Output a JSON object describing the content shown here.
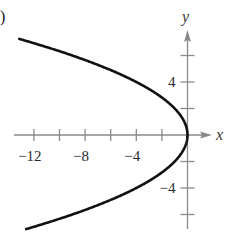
{
  "panel_label": ")",
  "chart_data": {
    "type": "line",
    "title": "",
    "equation": "y^2 = -4x",
    "xlabel": "x",
    "ylabel": "y",
    "xlim": [
      -12.2,
      1.6
    ],
    "ylim": [
      -7.2,
      7.8
    ],
    "grid": false,
    "legend": null,
    "x_ticks": [
      -12,
      -10,
      -8,
      -6,
      -4,
      -2
    ],
    "x_tick_labels": [
      {
        "value": -12,
        "label": "−12"
      },
      {
        "value": -8,
        "label": "−8"
      },
      {
        "value": -4,
        "label": "−4"
      }
    ],
    "y_ticks": [
      -6,
      -4,
      -2,
      2,
      4,
      6
    ],
    "y_tick_labels": [
      {
        "value": 4,
        "label": "4"
      },
      {
        "value": -4,
        "label": "−4"
      }
    ],
    "series": [
      {
        "name": "parabola",
        "color": "#111111",
        "points": [
          {
            "x": -12.25,
            "y": 7
          },
          {
            "x": -9,
            "y": 6
          },
          {
            "x": -6.25,
            "y": 5
          },
          {
            "x": -4,
            "y": 4
          },
          {
            "x": -2.25,
            "y": 3
          },
          {
            "x": -1,
            "y": 2
          },
          {
            "x": -0.25,
            "y": 1
          },
          {
            "x": 0,
            "y": 0
          },
          {
            "x": -0.25,
            "y": -1
          },
          {
            "x": -1,
            "y": -2
          },
          {
            "x": -2.25,
            "y": -3
          },
          {
            "x": -4,
            "y": -4
          },
          {
            "x": -6.25,
            "y": -5
          },
          {
            "x": -9,
            "y": -6
          },
          {
            "x": -12.25,
            "y": -7
          }
        ]
      }
    ]
  },
  "colors": {
    "curve": "#111111",
    "axis": "#8a8a8a",
    "text": "#2b2b2b"
  }
}
